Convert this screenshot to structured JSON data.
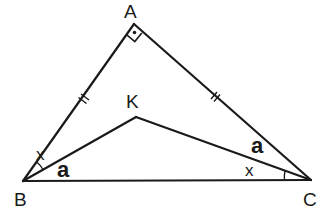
{
  "diagram": {
    "type": "geometry",
    "points": {
      "A": {
        "label": "A",
        "x": 134,
        "y": 24
      },
      "B": {
        "label": "B",
        "x": 23,
        "y": 181
      },
      "C": {
        "label": "C",
        "x": 311,
        "y": 180
      },
      "K": {
        "label": "K",
        "x": 136,
        "y": 117
      }
    },
    "segments": [
      "AB",
      "AC",
      "BC",
      "BK",
      "CK"
    ],
    "marks": {
      "right_angle": "A",
      "equal_sides": [
        "AB",
        "AC"
      ]
    },
    "angle_labels": {
      "ABK": "x",
      "KBC": "a",
      "ACK": "a",
      "KCB": "x"
    },
    "colors": {
      "stroke": "#1a1a1a",
      "background": "#ffffff"
    }
  }
}
